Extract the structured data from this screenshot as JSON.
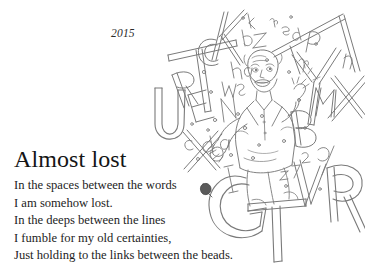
{
  "page": {
    "background_color": "#ffffff",
    "text_color": "#1d1d1d",
    "ink_color": "#6e6e6e"
  },
  "header": {
    "year": "2015"
  },
  "poem": {
    "title": "Almost lost",
    "lines": [
      "In the spaces between the words",
      "I am somehow lost.",
      "In the deeps between the lines",
      "I fumble for my old certainties,",
      "Just holding to the links between the beads."
    ]
  },
  "illustration": {
    "description": "Pen-and-ink line drawing of a distressed bald man in a suit surrounded by a cascade of scattered outlined alphabet letters",
    "big_letters": [
      "K",
      "T",
      "C",
      "R",
      "E",
      "U",
      "A",
      "Y",
      "P",
      "M",
      "X",
      "B",
      "G",
      "V",
      "R",
      "O",
      "I",
      "N",
      "S",
      "Q",
      "Z"
    ],
    "figure": "man-with-hands-raised"
  }
}
